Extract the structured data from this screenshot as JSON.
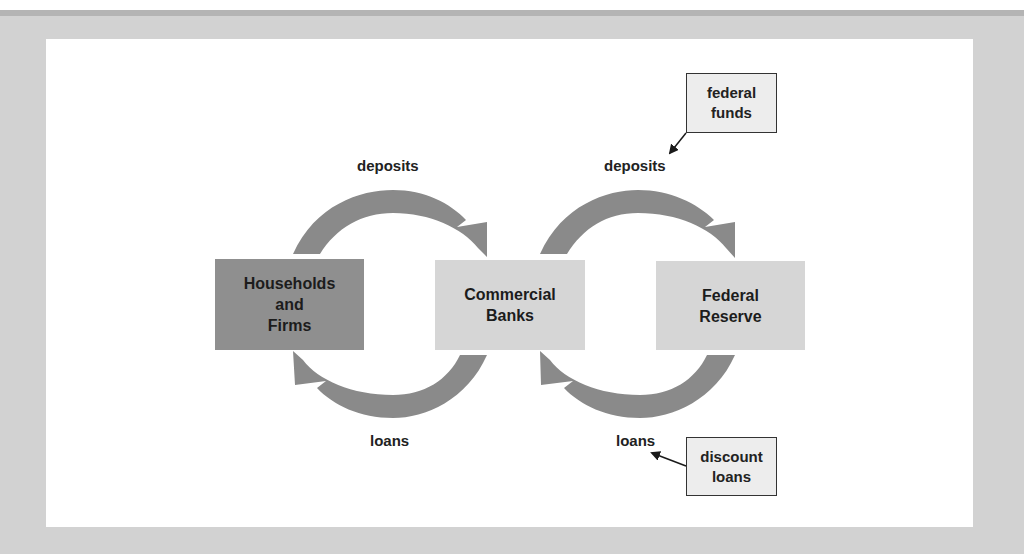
{
  "diagram": {
    "nodes": {
      "households": {
        "label": "Households\nand\nFirms",
        "fill": "#8f8f8f"
      },
      "commercial_banks": {
        "label": "Commercial\nBanks",
        "fill": "#d6d6d6"
      },
      "federal_reserve": {
        "label": "Federal\nReserve",
        "fill": "#d6d6d6"
      }
    },
    "flows": {
      "deposits_to_banks": "deposits",
      "deposits_to_fed": "deposits",
      "loans_to_households": "loans",
      "loans_to_banks": "loans"
    },
    "callouts": {
      "federal_funds": "federal\nfunds",
      "discount_loans": "discount\nloans"
    },
    "colors": {
      "arrow": "#8a8a8a",
      "panel": "#ffffff",
      "background": "#d2d2d2"
    }
  }
}
